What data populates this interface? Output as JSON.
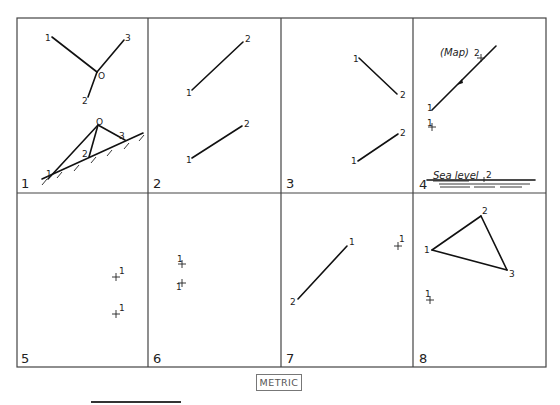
{
  "grid": {
    "x": [
      17,
      148,
      281,
      413,
      546
    ],
    "y": [
      18,
      193,
      367
    ]
  },
  "panels": [
    {
      "number": "1",
      "label_pos": [
        21,
        188
      ],
      "lines": [
        [
          [
            52,
            37
          ],
          [
            97,
            72
          ]
        ],
        [
          [
            97,
            72
          ],
          [
            124,
            40
          ]
        ],
        [
          [
            97,
            72
          ],
          [
            88,
            97
          ]
        ],
        [
          [
            48,
            179
          ],
          [
            98,
            125
          ]
        ],
        [
          [
            98,
            125
          ],
          [
            89,
            157
          ]
        ],
        [
          [
            98,
            125
          ],
          [
            125,
            140
          ]
        ],
        [
          [
            42,
            179
          ],
          [
            143,
            133
          ]
        ]
      ],
      "hatches": [
        [
          45,
          180
        ],
        [
          60,
          173
        ],
        [
          77,
          166
        ],
        [
          94,
          158
        ],
        [
          110,
          151
        ],
        [
          127,
          144
        ],
        [
          142,
          136
        ]
      ],
      "texts": [
        {
          "t": "1",
          "x": 45,
          "y": 41
        },
        {
          "t": "3",
          "x": 125,
          "y": 41
        },
        {
          "t": "O",
          "x": 98,
          "y": 79
        },
        {
          "t": "2",
          "x": 82,
          "y": 104
        },
        {
          "t": "O",
          "x": 96,
          "y": 125
        },
        {
          "t": "2",
          "x": 82,
          "y": 157
        },
        {
          "t": "3",
          "x": 119,
          "y": 139
        },
        {
          "t": "1",
          "x": 46,
          "y": 177
        }
      ]
    },
    {
      "number": "2",
      "label_pos": [
        153,
        188
      ],
      "lines": [
        [
          [
            192,
            90
          ],
          [
            243,
            42
          ]
        ],
        [
          [
            192,
            158
          ],
          [
            242,
            126
          ]
        ]
      ],
      "texts": [
        {
          "t": "2",
          "x": 245,
          "y": 42
        },
        {
          "t": "1",
          "x": 186,
          "y": 96
        },
        {
          "t": "2",
          "x": 244,
          "y": 127
        },
        {
          "t": "1",
          "x": 186,
          "y": 163
        }
      ]
    },
    {
      "number": "3",
      "label_pos": [
        286,
        188
      ],
      "lines": [
        [
          [
            359,
            58
          ],
          [
            397,
            94
          ]
        ],
        [
          [
            358,
            161
          ],
          [
            398,
            134
          ]
        ]
      ],
      "texts": [
        {
          "t": "1",
          "x": 353,
          "y": 62
        },
        {
          "t": "2",
          "x": 400,
          "y": 98
        },
        {
          "t": "2",
          "x": 400,
          "y": 136
        },
        {
          "t": "1",
          "x": 351,
          "y": 164
        }
      ]
    },
    {
      "number": "4",
      "label_pos": [
        419,
        189
      ],
      "lines": [
        [
          [
            432,
            110
          ],
          [
            496,
            46
          ]
        ]
      ],
      "arrow": {
        "x": 460,
        "y": 82
      },
      "crosses": [
        [
          481,
          58
        ],
        [
          432,
          127
        ]
      ],
      "texts": [
        {
          "t": "2",
          "x": 474,
          "y": 56
        },
        {
          "t": "1",
          "x": 427,
          "y": 111
        },
        {
          "t": "1",
          "x": 427,
          "y": 126
        }
      ],
      "map_label": "(Map)",
      "map_pos": [
        440,
        56
      ],
      "sea_label": "Sea level",
      "sea_pos": [
        433,
        181
      ],
      "sea_tick_label": "2",
      "sea_tick_x": 484,
      "sea_lines": [
        [
          [
            427,
            180
          ],
          [
            535,
            180
          ]
        ]
      ],
      "water_lines": [
        [
          [
            439,
            184
          ],
          [
            530,
            184
          ]
        ],
        [
          [
            440,
            187
          ],
          [
            470,
            187
          ]
        ],
        [
          [
            474,
            187
          ],
          [
            495,
            187
          ]
        ],
        [
          [
            500,
            187
          ],
          [
            522,
            187
          ]
        ]
      ]
    },
    {
      "number": "5",
      "label_pos": [
        21,
        363
      ],
      "crosses": [
        [
          116,
          277
        ],
        [
          116,
          314
        ]
      ],
      "texts": [
        {
          "t": "1",
          "x": 119,
          "y": 274
        },
        {
          "t": "1",
          "x": 119,
          "y": 311
        }
      ]
    },
    {
      "number": "6",
      "label_pos": [
        153,
        363
      ],
      "crosses": [
        [
          182,
          264
        ],
        [
          182,
          283
        ]
      ],
      "texts": [
        {
          "t": "1",
          "x": 177,
          "y": 262
        },
        {
          "t": "1",
          "x": 176,
          "y": 290
        }
      ]
    },
    {
      "number": "7",
      "label_pos": [
        286,
        363
      ],
      "lines": [
        [
          [
            298,
            299
          ],
          [
            347,
            246
          ]
        ]
      ],
      "crosses": [
        [
          398,
          246
        ]
      ],
      "texts": [
        {
          "t": "1",
          "x": 349,
          "y": 245
        },
        {
          "t": "2",
          "x": 290,
          "y": 305
        },
        {
          "t": "1",
          "x": 399,
          "y": 242
        }
      ]
    },
    {
      "number": "8",
      "label_pos": [
        419,
        363
      ],
      "lines": [
        [
          [
            432,
            250
          ],
          [
            481,
            216
          ]
        ],
        [
          [
            481,
            216
          ],
          [
            507,
            270
          ]
        ],
        [
          [
            507,
            270
          ],
          [
            432,
            250
          ]
        ]
      ],
      "crosses": [
        [
          430,
          300
        ]
      ],
      "texts": [
        {
          "t": "2",
          "x": 482,
          "y": 214
        },
        {
          "t": "1",
          "x": 424,
          "y": 253
        },
        {
          "t": "3",
          "x": 509,
          "y": 277
        },
        {
          "t": "1",
          "x": 425,
          "y": 297
        }
      ]
    }
  ],
  "footer": {
    "metric_label": "METRIC"
  },
  "colors": {
    "ink": "#111111",
    "grid": "#444444",
    "background": "#ffffff"
  }
}
